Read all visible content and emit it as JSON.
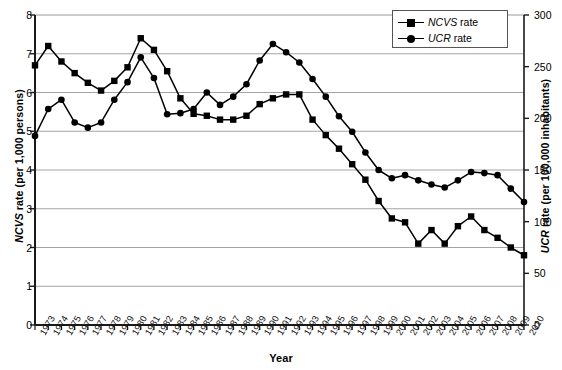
{
  "chart_data": {
    "type": "line",
    "title": "",
    "xlabel": "Year",
    "ylabel": "NCVS rate (per 1,000 persons)",
    "ylabel2": "UCR rate (per 100,000 inhabitants)",
    "grid": true,
    "legend_position": "top-right",
    "ylim": [
      0,
      8
    ],
    "yticks": [
      "0",
      "1",
      "2",
      "3",
      "4",
      "5",
      "6",
      "7",
      "8"
    ],
    "ylim2": [
      0,
      300
    ],
    "yticks2": [
      "0",
      "50",
      "100",
      "150",
      "200",
      "250",
      "300"
    ],
    "categories": [
      "1973",
      "1974",
      "1975",
      "1976",
      "1977",
      "1978",
      "1979",
      "1980",
      "1981",
      "1982",
      "1983",
      "1984",
      "1985",
      "1986",
      "1987",
      "1988",
      "1989",
      "1990",
      "1991",
      "1992",
      "1993",
      "1994",
      "1995",
      "1996",
      "1997",
      "1998",
      "1999",
      "2000",
      "2001",
      "2002",
      "2003",
      "2004",
      "2005",
      "2006",
      "2007",
      "2008",
      "2009",
      "2010"
    ],
    "series": [
      {
        "name": "NCVS rate",
        "axis": "left",
        "marker": "square",
        "values": [
          6.7,
          7.2,
          6.8,
          6.5,
          6.25,
          6.05,
          6.3,
          6.65,
          7.4,
          7.1,
          6.55,
          5.85,
          5.45,
          5.4,
          5.3,
          5.3,
          5.4,
          5.7,
          5.85,
          5.95,
          5.95,
          5.3,
          4.9,
          4.55,
          4.15,
          3.75,
          3.2,
          2.75,
          2.65,
          2.1,
          2.45,
          2.1,
          2.55,
          2.8,
          2.45,
          2.25,
          2.0,
          1.8
        ]
      },
      {
        "name": "UCR rate",
        "axis": "right",
        "marker": "circle",
        "values": [
          183,
          209,
          218,
          196,
          191,
          196,
          218,
          235,
          259,
          239,
          204,
          205,
          209,
          225,
          213,
          221,
          233,
          256,
          272,
          264,
          254,
          238,
          221,
          202,
          187,
          167,
          150,
          142,
          145,
          140,
          136,
          133,
          140,
          148,
          147,
          145,
          132,
          119
        ]
      }
    ]
  },
  "axes": {
    "left_title_prefix": "NCVS",
    "left_title_rest": " rate (per 1,000 persons)",
    "right_title_prefix": "UCR",
    "right_title_rest": " rate (per 100,000 inhabitants)",
    "x_title": "Year"
  },
  "legend": {
    "items": [
      {
        "prefix": "NCVS",
        "rest": " rate",
        "marker": "square"
      },
      {
        "prefix": "UCR",
        "rest": " rate",
        "marker": "circle"
      }
    ]
  },
  "colors": {
    "line": "#000000",
    "grid": "#9a9a9a",
    "axis": "#1a1a1a",
    "background": "#ffffff"
  }
}
